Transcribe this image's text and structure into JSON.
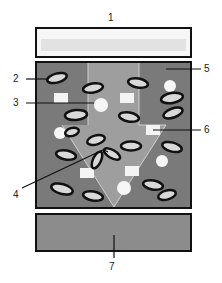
{
  "figure": {
    "labels": [
      {
        "id": "1",
        "text": "1",
        "x": 110,
        "y": 14
      },
      {
        "id": "2",
        "text": "2",
        "x": 14,
        "y": 77
      },
      {
        "id": "3",
        "text": "3",
        "x": 14,
        "y": 101
      },
      {
        "id": "4",
        "text": "4",
        "x": 14,
        "y": 192
      },
      {
        "id": "5",
        "text": "5",
        "x": 205,
        "y": 67
      },
      {
        "id": "6",
        "text": "6",
        "x": 205,
        "y": 127
      },
      {
        "id": "7",
        "text": "7",
        "x": 110,
        "y": 264
      }
    ],
    "colors": {
      "top_layer_fill": "#f4f4f4",
      "top_layer_band": "#e0e0e0",
      "middle_layer_fill": "#7a7a7a",
      "central_region_fill": "#9e9e9e",
      "bottom_layer_fill": "#8c8c8c",
      "outline": "#111111"
    }
  }
}
